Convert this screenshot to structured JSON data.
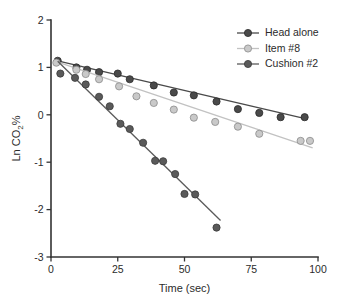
{
  "chart_data": {
    "type": "scatter",
    "title": "",
    "xlabel": "Time (sec)",
    "ylabel": "Ln CO2%",
    "ylabel_parts": {
      "pre": "Ln CO",
      "sub": "2",
      "post": "%"
    },
    "xlim": [
      0,
      100
    ],
    "ylim": [
      -3,
      2
    ],
    "xticks": [
      0,
      25,
      50,
      75,
      100
    ],
    "yticks": [
      2,
      1,
      0,
      -1,
      -2,
      -3
    ],
    "xticklabels": [
      "0",
      "25",
      "50",
      "75",
      "100"
    ],
    "yticklabels": [
      "2",
      "1",
      "0",
      "-1",
      "-2",
      "-3"
    ],
    "grid": false,
    "legend_position": "top-right",
    "marker_style": "filled-circle-with-outline",
    "has_fitted_lines": true,
    "series": [
      {
        "name": "Head alone",
        "color": "#4a4a4a",
        "marker_fill": "#4a4a4a",
        "marker_edge": "#2b2b2b",
        "line_color": "#4a4a4a",
        "points": [
          {
            "x": 2.5,
            "y": 1.14
          },
          {
            "x": 9.5,
            "y": 1.0
          },
          {
            "x": 13.5,
            "y": 0.95
          },
          {
            "x": 18.0,
            "y": 0.9
          },
          {
            "x": 25.0,
            "y": 0.87
          },
          {
            "x": 29.5,
            "y": 0.75
          },
          {
            "x": 38.5,
            "y": 0.62
          },
          {
            "x": 46.0,
            "y": 0.47
          },
          {
            "x": 53.5,
            "y": 0.41
          },
          {
            "x": 62.0,
            "y": 0.28
          },
          {
            "x": 70.0,
            "y": 0.12
          },
          {
            "x": 78.0,
            "y": 0.04
          },
          {
            "x": 86.0,
            "y": -0.05
          },
          {
            "x": 95.0,
            "y": -0.05
          }
        ],
        "fit": {
          "x0": 2.5,
          "y0": 1.14,
          "x1": 96.0,
          "y1": -0.09
        }
      },
      {
        "name": "Item #8",
        "color": "#c2c2c2",
        "marker_fill": "#c9c9c9",
        "marker_edge": "#8a8a8a",
        "line_color": "#c2c2c2",
        "points": [
          {
            "x": 2.0,
            "y": 1.1
          },
          {
            "x": 9.5,
            "y": 0.95
          },
          {
            "x": 13.0,
            "y": 0.86
          },
          {
            "x": 18.0,
            "y": 0.75
          },
          {
            "x": 25.5,
            "y": 0.6
          },
          {
            "x": 32.0,
            "y": 0.39
          },
          {
            "x": 38.5,
            "y": 0.25
          },
          {
            "x": 46.0,
            "y": 0.11
          },
          {
            "x": 53.5,
            "y": -0.06
          },
          {
            "x": 61.5,
            "y": -0.15
          },
          {
            "x": 70.0,
            "y": -0.25
          },
          {
            "x": 78.0,
            "y": -0.4
          },
          {
            "x": 93.5,
            "y": -0.55
          },
          {
            "x": 97.0,
            "y": -0.55
          }
        ],
        "fit": {
          "x0": 2.0,
          "y0": 1.12,
          "x1": 98.0,
          "y1": -0.7
        }
      },
      {
        "name": "Cushion #2",
        "color": "#5a5a5a",
        "marker_fill": "#5a5a5a",
        "marker_edge": "#3a3a3a",
        "line_color": "#5a5a5a",
        "points": [
          {
            "x": 3.5,
            "y": 0.87
          },
          {
            "x": 9.0,
            "y": 0.78
          },
          {
            "x": 13.0,
            "y": 0.64
          },
          {
            "x": 18.0,
            "y": 0.38
          },
          {
            "x": 22.0,
            "y": 0.18
          },
          {
            "x": 26.0,
            "y": -0.19
          },
          {
            "x": 29.5,
            "y": -0.3
          },
          {
            "x": 34.5,
            "y": -0.59
          },
          {
            "x": 39.0,
            "y": -0.97
          },
          {
            "x": 42.0,
            "y": -0.98
          },
          {
            "x": 46.5,
            "y": -1.25
          },
          {
            "x": 50.0,
            "y": -1.67
          },
          {
            "x": 54.0,
            "y": -1.68
          },
          {
            "x": 62.0,
            "y": -2.38
          }
        ],
        "fit": {
          "x0": 2.5,
          "y0": 1.13,
          "x1": 63.5,
          "y1": -2.23
        }
      }
    ]
  },
  "legend": {
    "entries": [
      {
        "label": "Head alone"
      },
      {
        "label": "Item #8"
      },
      {
        "label": "Cushion #2"
      }
    ]
  }
}
